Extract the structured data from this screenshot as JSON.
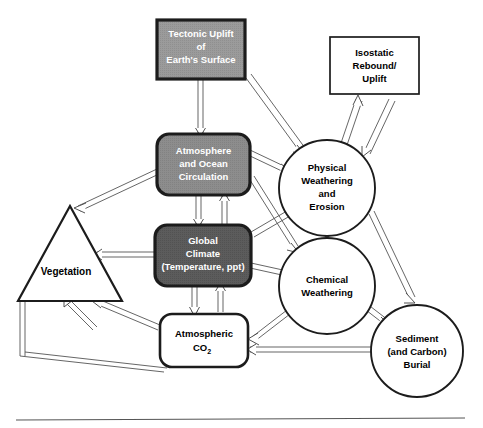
{
  "diagram": {
    "title_visible": false,
    "colors": {
      "tectonic_fill": "#9a9a9a",
      "atmosphere_fill": "#8e8e8e",
      "climate_fill": "#5a5a5a",
      "white_fill": "#ffffff",
      "stroke": "#1a1a1a",
      "arrow_stroke": "#4a4a4a",
      "rule": "#555555"
    },
    "nodes": [
      {
        "id": "tectonic",
        "name": "tectonic-uplift-box",
        "shape": "rect",
        "fill": "tectonic_fill",
        "text_color": "light",
        "lines": [
          "Tectonic Uplift",
          "of",
          "Earth's Surface"
        ]
      },
      {
        "id": "isostatic",
        "name": "isostatic-rebound-box",
        "shape": "rect",
        "fill": "white_fill",
        "text_color": "dark",
        "lines": [
          "Isostatic",
          "Rebound/",
          "Uplift"
        ]
      },
      {
        "id": "atmosphere",
        "name": "atmosphere-ocean-circulation-box",
        "shape": "rounded-rect",
        "fill": "atmosphere_fill",
        "text_color": "light",
        "lines": [
          "Atmosphere",
          "and Ocean",
          "Circulation"
        ]
      },
      {
        "id": "climate",
        "name": "global-climate-box",
        "shape": "rounded-rect",
        "fill": "climate_fill",
        "text_color": "light",
        "lines": [
          "Global",
          "Climate",
          "(Temperature, ppt)"
        ]
      },
      {
        "id": "co2",
        "name": "atmospheric-co2-box",
        "shape": "rounded-rect",
        "fill": "white_fill",
        "text_color": "dark",
        "lines": [
          "Atmospheric",
          "CO2"
        ],
        "subscript": "2"
      },
      {
        "id": "vegetation",
        "name": "vegetation-triangle",
        "shape": "triangle",
        "fill": "white_fill",
        "text_color": "dark",
        "lines": [
          "Vegetation"
        ]
      },
      {
        "id": "physical",
        "name": "physical-weathering-circle",
        "shape": "circle",
        "fill": "white_fill",
        "text_color": "dark",
        "lines": [
          "Physical",
          "Weathering",
          "and",
          "Erosion"
        ]
      },
      {
        "id": "chemical",
        "name": "chemical-weathering-circle",
        "shape": "circle",
        "fill": "white_fill",
        "text_color": "dark",
        "lines": [
          "Chemical",
          "Weathering"
        ]
      },
      {
        "id": "sediment",
        "name": "sediment-burial-circle",
        "shape": "circle",
        "fill": "white_fill",
        "text_color": "dark",
        "lines": [
          "Sediment",
          "(and Carbon)",
          "Burial"
        ]
      }
    ],
    "edges": [
      {
        "from": "tectonic",
        "to": "atmosphere",
        "style": "double-line-arrow"
      },
      {
        "from": "tectonic",
        "to": "physical",
        "style": "double-line-arrow"
      },
      {
        "from": "physical",
        "to": "isostatic",
        "style": "double-line-arrow"
      },
      {
        "from": "isostatic",
        "to": "physical",
        "style": "double-line-arrow"
      },
      {
        "from": "atmosphere",
        "to": "climate",
        "style": "double-line-arrow"
      },
      {
        "from": "climate",
        "to": "atmosphere",
        "style": "double-line-arrow"
      },
      {
        "from": "atmosphere",
        "to": "vegetation",
        "style": "double-line-arrow"
      },
      {
        "from": "atmosphere",
        "to": "physical",
        "style": "double-line-arrow"
      },
      {
        "from": "atmosphere",
        "to": "chemical",
        "style": "double-line-arrow"
      },
      {
        "from": "climate",
        "to": "vegetation",
        "style": "double-line-arrow"
      },
      {
        "from": "climate",
        "to": "physical",
        "style": "double-line-arrow"
      },
      {
        "from": "climate",
        "to": "chemical",
        "style": "double-line-arrow"
      },
      {
        "from": "climate",
        "to": "co2",
        "style": "double-line-arrow"
      },
      {
        "from": "co2",
        "to": "climate",
        "style": "double-line-arrow"
      },
      {
        "from": "co2",
        "to": "vegetation",
        "style": "double-line-arrow"
      },
      {
        "from": "vegetation",
        "to": "co2",
        "style": "double-line-arrow"
      },
      {
        "from": "chemical",
        "to": "co2",
        "style": "double-line-arrow"
      },
      {
        "from": "chemical",
        "to": "sediment",
        "style": "double-line-arrow"
      },
      {
        "from": "physical",
        "to": "chemical",
        "style": "double-line-arrow"
      },
      {
        "from": "physical",
        "to": "sediment",
        "style": "double-line-arrow"
      },
      {
        "from": "sediment",
        "to": "co2",
        "style": "double-line-arrow"
      },
      {
        "from": "vegetation",
        "to": "chemical",
        "style": "double-line-arrow"
      }
    ],
    "footer_rule": true
  }
}
